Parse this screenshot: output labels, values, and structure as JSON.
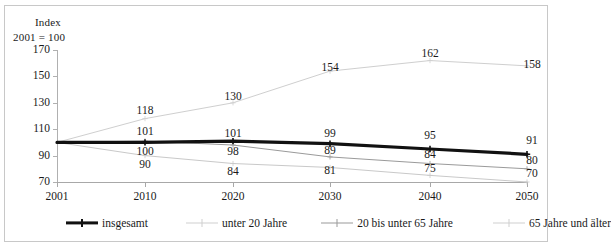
{
  "chart_data": {
    "type": "line",
    "title": "",
    "axis_title_top": "Index",
    "axis_title_base": "2001 = 100",
    "xlabel": "",
    "ylabel": "Index",
    "categories": [
      "2001",
      "2010",
      "2020",
      "2030",
      "2040",
      "2050"
    ],
    "x": [
      2001,
      2010,
      2020,
      2030,
      2040,
      2050
    ],
    "ylim": [
      70,
      170
    ],
    "yticks": [
      70,
      90,
      110,
      130,
      150,
      170
    ],
    "grid": false,
    "legend_position": "bottom",
    "series": [
      {
        "name": "insgesamt",
        "values": [
          100,
          100,
          101,
          99,
          95,
          91
        ],
        "labels": [
          "",
          "100",
          "101",
          "99",
          "95",
          "91"
        ],
        "color": "#111111",
        "width": 3.2,
        "marker": "cross"
      },
      {
        "name": "unter 20 Jahre",
        "values": [
          100,
          90,
          84,
          81,
          75,
          70
        ],
        "labels": [
          "",
          "90",
          "84",
          "81",
          "75",
          "70"
        ],
        "color": "#c9c9c9",
        "width": 1,
        "marker": "cross"
      },
      {
        "name": "20 bis unter 65 Jahre",
        "values": [
          100,
          101,
          98,
          89,
          84,
          80
        ],
        "labels": [
          "",
          "101",
          "98",
          "89",
          "84",
          "80"
        ],
        "color": "#9a9a9a",
        "width": 1,
        "marker": "cross"
      },
      {
        "name": "65 Jahre und älter",
        "values": [
          100,
          118,
          130,
          154,
          162,
          158
        ],
        "labels": [
          "",
          "118",
          "130",
          "154",
          "162",
          "158"
        ],
        "color": "#cfcfcf",
        "width": 1,
        "marker": "cross"
      }
    ],
    "value_labels": [
      {
        "text": "118",
        "x": 145,
        "y": 104
      },
      {
        "text": "101",
        "x": 145,
        "y": 125
      },
      {
        "text": "100",
        "x": 145,
        "y": 145
      },
      {
        "text": "90",
        "x": 145,
        "y": 158
      },
      {
        "text": "130",
        "x": 233,
        "y": 90
      },
      {
        "text": "101",
        "x": 233,
        "y": 127
      },
      {
        "text": "98",
        "x": 233,
        "y": 145
      },
      {
        "text": "84",
        "x": 233,
        "y": 165
      },
      {
        "text": "154",
        "x": 330,
        "y": 61
      },
      {
        "text": "99",
        "x": 330,
        "y": 127
      },
      {
        "text": "89",
        "x": 330,
        "y": 144
      },
      {
        "text": "81",
        "x": 330,
        "y": 164
      },
      {
        "text": "162",
        "x": 430,
        "y": 47
      },
      {
        "text": "95",
        "x": 430,
        "y": 129
      },
      {
        "text": "84",
        "x": 430,
        "y": 148
      },
      {
        "text": "75",
        "x": 430,
        "y": 162
      },
      {
        "text": "158",
        "x": 532,
        "y": 58
      },
      {
        "text": "91",
        "x": 532,
        "y": 134
      },
      {
        "text": "80",
        "x": 532,
        "y": 154
      },
      {
        "text": "70",
        "x": 532,
        "y": 167
      }
    ]
  },
  "y_axis": {
    "labels": [
      "170",
      "150",
      "130",
      "110",
      "90",
      "70"
    ]
  },
  "x_axis": {
    "labels": [
      "2001",
      "2010",
      "2020",
      "2030",
      "2040",
      "2050"
    ]
  },
  "legend": {
    "items": [
      {
        "label": "insgesamt",
        "color": "#111111",
        "width": "3.2px"
      },
      {
        "label": "unter 20 Jahre",
        "color": "#cfcfcf",
        "width": "1px"
      },
      {
        "label": "20 bis unter 65 Jahre",
        "color": "#9a9a9a",
        "width": "1px"
      },
      {
        "label": "65 Jahre und älter",
        "color": "#cfcfcf",
        "width": "1px"
      }
    ]
  }
}
